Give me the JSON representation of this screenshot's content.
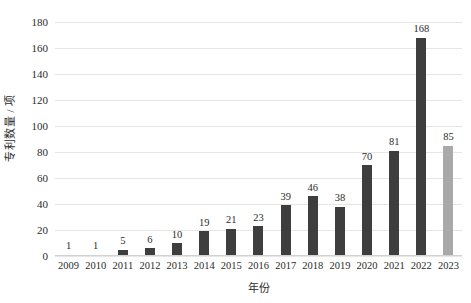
{
  "chart_data": {
    "type": "bar",
    "title": "",
    "subtitle": "",
    "xlabel": "年份",
    "ylabel": "专利数量 / 项",
    "categories": [
      "2009",
      "2010",
      "2011",
      "2012",
      "2013",
      "2014",
      "2015",
      "2016",
      "2017",
      "2018",
      "2019",
      "2020",
      "2021",
      "2022",
      "2023"
    ],
    "values": [
      1,
      1,
      5,
      6,
      10,
      19,
      21,
      23,
      39,
      46,
      38,
      70,
      81,
      168,
      85
    ],
    "ylim": [
      0,
      180
    ],
    "ytick_step": 20,
    "yticks": [
      "0",
      "20",
      "40",
      "60",
      "80",
      "100",
      "120",
      "140",
      "160",
      "180"
    ],
    "grid": true,
    "legend": "none",
    "bar_colors": [
      "#3e3e3e",
      "#3e3e3e",
      "#3e3e3e",
      "#3e3e3e",
      "#3e3e3e",
      "#3e3e3e",
      "#3e3e3e",
      "#3e3e3e",
      "#3e3e3e",
      "#3e3e3e",
      "#3e3e3e",
      "#3e3e3e",
      "#3e3e3e",
      "#3e3e3e",
      "#a9a9a9"
    ],
    "highlight_category": "2023",
    "colors": {
      "bar_primary": "#3e3e3e",
      "bar_highlight": "#a9a9a9",
      "gridline": "#e6e6e6",
      "axis": "#d2d2d2",
      "text": "#2b2b2b",
      "background": "#ffffff"
    },
    "data_labels": [
      "1",
      "1",
      "5",
      "6",
      "10",
      "19",
      "21",
      "23",
      "39",
      "46",
      "38",
      "70",
      "81",
      "168",
      "85"
    ]
  }
}
